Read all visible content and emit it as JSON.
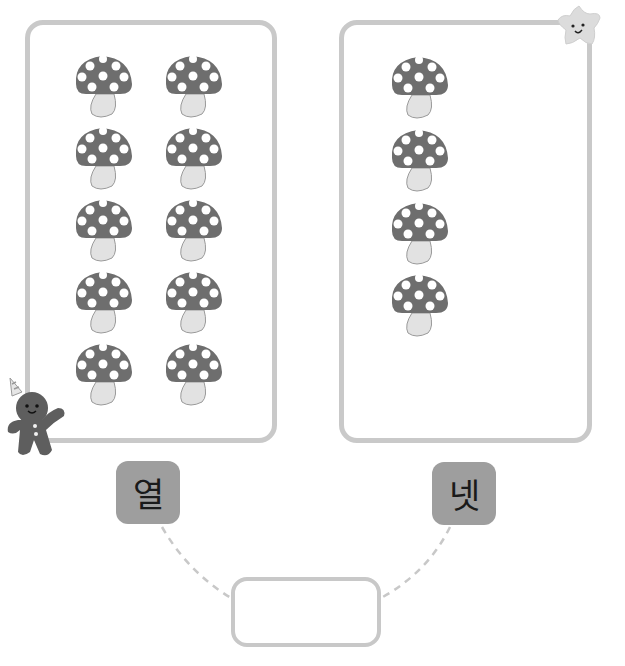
{
  "panels": [
    {
      "id": "left",
      "mushroom_count": 10,
      "label": "열"
    },
    {
      "id": "right",
      "mushroom_count": 4,
      "label": "넷"
    }
  ],
  "answer_box": {
    "value": ""
  },
  "colors": {
    "panel_border": "#c9c9c9",
    "mushroom_cap": "#6e6e6e",
    "mushroom_stem": "#e2e2e2",
    "label_bg": "#9e9e9e",
    "dash": "#c8c8c8"
  },
  "icons": {
    "mushroom": "mushroom-icon",
    "star": "smiling-star-icon",
    "gingerbread": "gingerbread-man-icon"
  }
}
